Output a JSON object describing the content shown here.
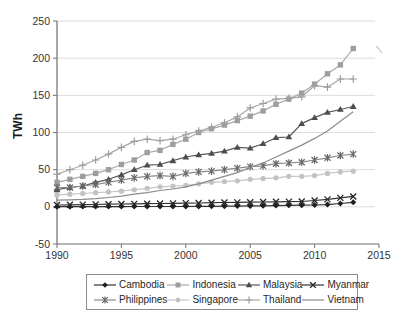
{
  "figure": {
    "background": "#ffffff"
  },
  "chart_data": {
    "type": "line",
    "title": "",
    "xlabel": "",
    "ylabel": "TWh",
    "ylim": [
      -50,
      250
    ],
    "xlim": [
      1990,
      2015
    ],
    "yticks": [
      -50,
      0,
      50,
      100,
      150,
      200,
      250
    ],
    "gridline_values": [
      0,
      50,
      100,
      150,
      200,
      250
    ],
    "xticks": [
      1990,
      1995,
      2000,
      2005,
      2010,
      2015
    ],
    "grid": "horizontal",
    "legend_position": "bottom-box",
    "x": [
      1990,
      1991,
      1992,
      1993,
      1994,
      1995,
      1996,
      1997,
      1998,
      1999,
      2000,
      2001,
      2002,
      2003,
      2004,
      2005,
      2006,
      2007,
      2008,
      2009,
      2010,
      2011,
      2012,
      2013
    ],
    "series": [
      {
        "name": "Cambodia",
        "marker": "diamond",
        "color": "#1f1f1f",
        "line_color": "#333333",
        "values": [
          0.2,
          0.2,
          0.3,
          0.3,
          0.3,
          0.3,
          0.4,
          0.4,
          0.4,
          0.5,
          0.5,
          0.6,
          0.7,
          0.8,
          1.0,
          1.2,
          1.4,
          1.7,
          2.0,
          2.2,
          2.5,
          3.0,
          4.5,
          6.0
        ]
      },
      {
        "name": "Indonesia",
        "marker": "square",
        "color": "#9e9e9e",
        "line_color": "#a8a8a8",
        "values": [
          33,
          37,
          41,
          45,
          50,
          57,
          63,
          73,
          76,
          84,
          91,
          100,
          105,
          110,
          116,
          122,
          129,
          138,
          145,
          153,
          165,
          179,
          191,
          213
        ]
      },
      {
        "name": "Malaysia",
        "marker": "triangle",
        "color": "#4d4d4d",
        "line_color": "#595959",
        "values": [
          23,
          26,
          28,
          33,
          37,
          43,
          50,
          56,
          57,
          62,
          67,
          70,
          72,
          75,
          80,
          79,
          85,
          93,
          94,
          112,
          120,
          127,
          131,
          135
        ]
      },
      {
        "name": "Myanmar",
        "marker": "x",
        "color": "#262626",
        "line_color": "#333333",
        "values": [
          2.5,
          2.7,
          3.0,
          3.2,
          3.5,
          3.8,
          4.0,
          4.2,
          4.5,
          4.7,
          5.0,
          5.2,
          5.5,
          5.8,
          6.0,
          6.2,
          6.5,
          6.8,
          7.0,
          7.2,
          8.5,
          10.0,
          12.0,
          14.0
        ]
      },
      {
        "name": "Philippines",
        "marker": "star",
        "color": "#666666",
        "line_color": "#8a8a8a",
        "values": [
          26,
          26,
          28,
          30,
          33,
          36,
          39,
          41,
          42,
          41,
          45,
          47,
          48,
          50,
          52,
          54,
          55,
          58,
          59,
          60,
          63,
          66,
          69,
          71
        ]
      },
      {
        "name": "Singapore",
        "marker": "circle",
        "color": "#c2c2c2",
        "line_color": "#c6c6c6",
        "values": [
          16,
          17,
          18,
          19,
          20,
          21,
          23,
          25,
          27,
          28,
          29,
          31,
          33,
          34,
          35,
          37,
          38,
          39,
          41,
          41,
          42,
          45,
          47,
          48
        ]
      },
      {
        "name": "Thailand",
        "marker": "plus",
        "color": "#9e9e9e",
        "line_color": "#a8a8a8",
        "values": [
          44,
          50,
          56,
          63,
          71,
          80,
          88,
          91,
          89,
          91,
          97,
          102,
          107,
          113,
          121,
          133,
          139,
          145,
          146,
          148,
          163,
          161,
          172,
          172
        ]
      },
      {
        "name": "Vietnam",
        "marker": "none",
        "color": "#8c8c8c",
        "line_color": "#8c8c8c",
        "values": [
          9,
          9.5,
          10,
          11,
          12.5,
          14.5,
          17,
          19,
          22,
          24,
          27,
          31,
          36,
          41,
          46,
          53,
          59,
          67,
          75,
          83,
          92,
          102,
          115,
          128
        ]
      }
    ]
  },
  "style_colors": {
    "grid": "#dcdcdc",
    "axis": "#6e6e6e",
    "tick_text": "#333333",
    "legend_border": "#8c8c8c",
    "artifact": "#b8b8b8"
  }
}
